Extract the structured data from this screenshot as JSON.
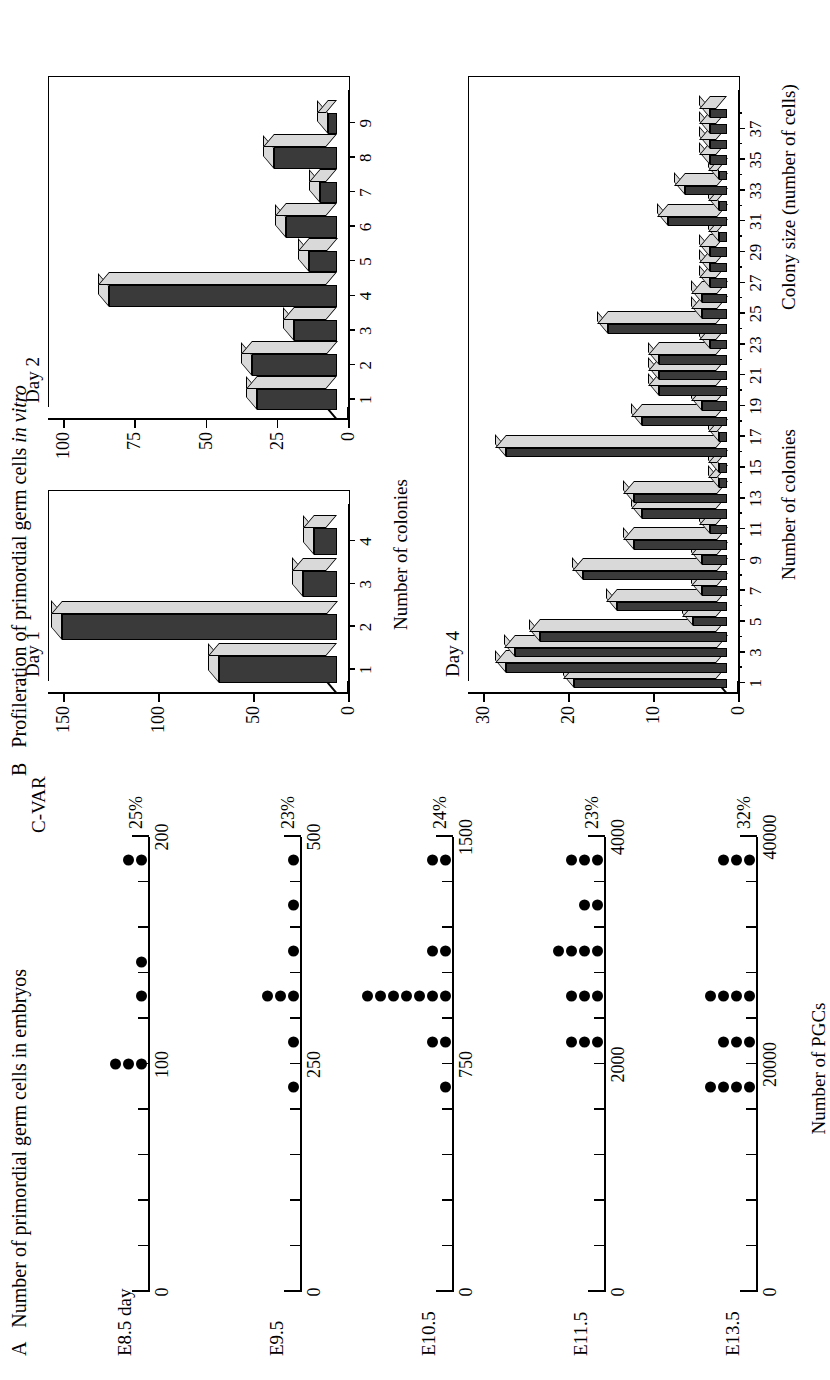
{
  "figure": {
    "panelA": {
      "letter": "A",
      "title": "Number of primordial germ cells in embryos",
      "cvar_header": "C-VAR",
      "xaxis_title": "Number of PGCs",
      "rows": [
        {
          "label": "E8.5 day",
          "cvar": "25%",
          "max": 200,
          "tick_labels": [
            {
              "v": 0,
              "t": "0"
            },
            {
              "v": 100,
              "t": "100"
            },
            {
              "v": 200,
              "t": "200"
            }
          ],
          "tick_step": 20,
          "stacks": [
            {
              "v": 100,
              "n": 3
            },
            {
              "v": 130,
              "n": 1
            },
            {
              "v": 145,
              "n": 1
            },
            {
              "v": 190,
              "n": 2
            }
          ]
        },
        {
          "label": "E9.5",
          "cvar": "23%",
          "max": 500,
          "tick_labels": [
            {
              "v": 0,
              "t": "0"
            },
            {
              "v": 250,
              "t": "250"
            },
            {
              "v": 500,
              "t": "500"
            }
          ],
          "tick_step": 50,
          "stacks": [
            {
              "v": 225,
              "n": 1
            },
            {
              "v": 275,
              "n": 1
            },
            {
              "v": 325,
              "n": 3
            },
            {
              "v": 375,
              "n": 1
            },
            {
              "v": 425,
              "n": 1
            },
            {
              "v": 475,
              "n": 1
            }
          ]
        },
        {
          "label": "E10.5",
          "cvar": "24%",
          "max": 1500,
          "tick_labels": [
            {
              "v": 0,
              "t": "0"
            },
            {
              "v": 750,
              "t": "750"
            },
            {
              "v": 1500,
              "t": "1500"
            }
          ],
          "tick_step": 150,
          "stacks": [
            {
              "v": 675,
              "n": 1
            },
            {
              "v": 825,
              "n": 2
            },
            {
              "v": 975,
              "n": 7
            },
            {
              "v": 1125,
              "n": 2
            },
            {
              "v": 1425,
              "n": 2
            }
          ]
        },
        {
          "label": "E11.5",
          "cvar": "23%",
          "max": 4000,
          "tick_labels": [
            {
              "v": 0,
              "t": "0"
            },
            {
              "v": 2000,
              "t": "2000"
            },
            {
              "v": 4000,
              "t": "4000"
            }
          ],
          "tick_step": 400,
          "stacks": [
            {
              "v": 2200,
              "n": 3
            },
            {
              "v": 2600,
              "n": 3
            },
            {
              "v": 3000,
              "n": 4
            },
            {
              "v": 3400,
              "n": 2
            },
            {
              "v": 3800,
              "n": 3
            }
          ]
        },
        {
          "label": "E13.5",
          "cvar": "32%",
          "max": 40000,
          "tick_labels": [
            {
              "v": 0,
              "t": "0"
            },
            {
              "v": 20000,
              "t": "20000"
            },
            {
              "v": 40000,
              "t": "40000"
            }
          ],
          "tick_step": 4000,
          "stacks": [
            {
              "v": 18000,
              "n": 4
            },
            {
              "v": 22000,
              "n": 3
            },
            {
              "v": 26000,
              "n": 4
            },
            {
              "v": 38000,
              "n": 3
            }
          ]
        }
      ]
    },
    "panelB": {
      "letter": "B",
      "title_plain": "Profileration of primordial germ cells ",
      "title_italic": "in vitro",
      "yaxis_title": "Number of colonies",
      "xaxis_title": "Colony size (number of cells)"
    }
  },
  "chart_data": [
    {
      "type": "bar",
      "title": "Day 1",
      "categories": [
        1,
        2,
        3,
        4
      ],
      "values": [
        62,
        145,
        18,
        12
      ],
      "xlabel": "",
      "ylabel": "Number of colonies",
      "ylim": [
        0,
        150
      ],
      "ytick_labels": [
        "0",
        "50",
        "100",
        "150"
      ],
      "ytick_values": [
        0,
        50,
        100,
        150
      ],
      "xtick_labels": [
        "1",
        "2",
        "3",
        "4"
      ],
      "grid": false,
      "legend": "none"
    },
    {
      "type": "bar",
      "title": "Day 2",
      "categories": [
        1,
        2,
        3,
        4,
        5,
        6,
        7,
        8,
        9
      ],
      "values": [
        28,
        30,
        15,
        80,
        10,
        18,
        6,
        22,
        3
      ],
      "xlabel": "",
      "ylabel": "Number of colonies",
      "ylim": [
        0,
        100
      ],
      "ytick_labels": [
        "0",
        "25",
        "50",
        "75",
        "100"
      ],
      "ytick_values": [
        0,
        25,
        50,
        75,
        100
      ],
      "xtick_labels": [
        "1",
        "2",
        "3",
        "4",
        "5",
        "6",
        "7",
        "8",
        "9"
      ],
      "grid": false,
      "legend": "none"
    },
    {
      "type": "bar",
      "title": "Day 4",
      "categories": [
        1,
        2,
        3,
        4,
        5,
        6,
        7,
        8,
        9,
        10,
        11,
        12,
        13,
        14,
        15,
        16,
        17,
        18,
        19,
        20,
        21,
        22,
        23,
        24,
        25,
        26,
        27,
        28,
        29,
        30,
        31,
        32,
        33,
        34,
        35,
        36,
        37,
        38
      ],
      "values": [
        18,
        26,
        25,
        22,
        4,
        13,
        3,
        17,
        3,
        11,
        2,
        10,
        11,
        1,
        1,
        26,
        1,
        10,
        3,
        8,
        8,
        8,
        2,
        14,
        3,
        3,
        2,
        2,
        2,
        1,
        7,
        1,
        5,
        1,
        2,
        2,
        2,
        2
      ],
      "xlabel": "Colony size (number of cells)",
      "ylabel": "Number of colonies",
      "ylim": [
        0,
        30
      ],
      "ytick_labels": [
        "0",
        "10",
        "20",
        "30"
      ],
      "ytick_values": [
        0,
        10,
        20,
        30
      ],
      "xtick_labels": [
        "1",
        "3",
        "5",
        "7",
        "9",
        "11",
        "13",
        "15",
        "17",
        "19",
        "21",
        "23",
        "25",
        "27",
        "29",
        "31",
        "33",
        "35",
        "37"
      ],
      "grid": false,
      "legend": "none"
    }
  ],
  "colors": {
    "bar_front": "#3a3a3a",
    "bar_top": "#d9d9d9",
    "bar_cap": "#ffffff",
    "axis": "#000000",
    "dot": "#000000"
  }
}
